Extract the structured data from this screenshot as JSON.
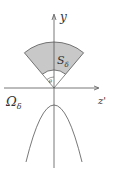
{
  "diagram": {
    "axes": {
      "vertical_label": "y",
      "horizontal_label": "z'"
    },
    "region_labels": {
      "sector": "S",
      "sector_sub": "δ",
      "domain": "Ω",
      "domain_sub": "δ",
      "angle": "θ"
    },
    "colors": {
      "sector_fill": "#c8c8c8",
      "stroke": "#555555"
    }
  }
}
